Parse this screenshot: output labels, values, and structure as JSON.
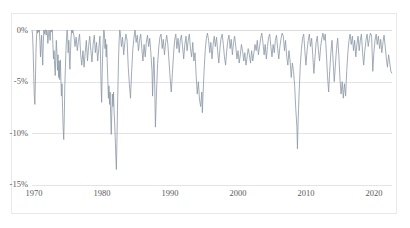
{
  "page": {
    "clipped_top_text": "",
    "background_color": "#ffffff",
    "frame_border_color": "#e9e9ea"
  },
  "chart_data": {
    "type": "line",
    "title": "",
    "subtitle": "",
    "xlabel": "",
    "ylabel": "",
    "grid": true,
    "legend": "none",
    "line_color": "#8a97a5",
    "line_width": 0.8,
    "xlim": [
      1970,
      2023
    ],
    "ylim": [
      -15,
      0
    ],
    "xticks": [
      1970,
      1980,
      1990,
      2000,
      2010,
      2020
    ],
    "xticklabels": [
      "1970",
      "1980",
      "1990",
      "2000",
      "2010",
      "2020"
    ],
    "yticks": [
      0,
      -5,
      -10,
      -15
    ],
    "yticklabels": [
      "0%",
      "-5%",
      "-10%",
      "-15%"
    ],
    "units": "percent",
    "annotations": [],
    "series": [
      {
        "name": "Drawdown",
        "x": [
          1970.0,
          1970.08,
          1970.17,
          1970.25,
          1970.33,
          1970.42,
          1970.5,
          1970.58,
          1970.67,
          1970.75,
          1970.83,
          1970.92,
          1971.0,
          1971.08,
          1971.17,
          1971.25,
          1971.33,
          1971.42,
          1971.5,
          1971.58,
          1971.67,
          1971.75,
          1971.83,
          1971.92,
          1972.0,
          1972.08,
          1972.17,
          1972.25,
          1972.33,
          1972.42,
          1972.5,
          1972.58,
          1972.67,
          1972.75,
          1972.83,
          1972.92,
          1973.0,
          1973.08,
          1973.17,
          1973.25,
          1973.33,
          1973.42,
          1973.5,
          1973.58,
          1973.67,
          1973.75,
          1973.83,
          1973.92,
          1974.0,
          1974.08,
          1974.17,
          1974.25,
          1974.33,
          1974.42,
          1974.5,
          1974.58,
          1974.67,
          1974.75,
          1974.83,
          1974.92,
          1975.0,
          1975.08,
          1975.17,
          1975.25,
          1975.33,
          1975.42,
          1975.5,
          1975.58,
          1975.67,
          1975.75,
          1975.83,
          1975.92,
          1976.0,
          1976.17,
          1976.33,
          1976.5,
          1976.67,
          1976.83,
          1977.0,
          1977.17,
          1977.33,
          1977.5,
          1977.67,
          1977.83,
          1978.0,
          1978.17,
          1978.33,
          1978.5,
          1978.67,
          1978.83,
          1979.0,
          1979.17,
          1979.33,
          1979.5,
          1979.67,
          1979.83,
          1980.0,
          1980.08,
          1980.17,
          1980.25,
          1980.33,
          1980.42,
          1980.5,
          1980.58,
          1980.67,
          1980.75,
          1980.83,
          1980.92,
          1981.0,
          1981.08,
          1981.17,
          1981.25,
          1981.33,
          1981.42,
          1981.5,
          1981.58,
          1981.67,
          1981.75,
          1981.83,
          1981.92,
          1982.0,
          1982.08,
          1982.17,
          1982.25,
          1982.33,
          1982.42,
          1982.5,
          1982.58,
          1982.67,
          1982.75,
          1982.83,
          1982.92,
          1983.0,
          1983.17,
          1983.33,
          1983.5,
          1983.67,
          1983.83,
          1984.0,
          1984.17,
          1984.33,
          1984.5,
          1984.67,
          1984.83,
          1985.0,
          1985.17,
          1985.33,
          1985.5,
          1985.67,
          1985.83,
          1986.0,
          1986.17,
          1986.33,
          1986.5,
          1986.67,
          1986.83,
          1987.0,
          1987.17,
          1987.33,
          1987.5,
          1987.67,
          1987.75,
          1987.83,
          1987.92,
          1988.0,
          1988.08,
          1988.17,
          1988.33,
          1988.5,
          1988.67,
          1988.83,
          1989.0,
          1989.17,
          1989.33,
          1989.5,
          1989.67,
          1989.83,
          1990.0,
          1990.17,
          1990.33,
          1990.5,
          1990.67,
          1990.83,
          1991.0,
          1991.17,
          1991.33,
          1991.5,
          1991.67,
          1991.83,
          1992.0,
          1992.17,
          1992.33,
          1992.5,
          1992.67,
          1992.83,
          1993.0,
          1993.17,
          1993.33,
          1993.5,
          1993.67,
          1993.83,
          1994.0,
          1994.17,
          1994.33,
          1994.5,
          1994.67,
          1994.83,
          1995.0,
          1995.08,
          1995.17,
          1995.33,
          1995.5,
          1995.67,
          1995.83,
          1996.0,
          1996.17,
          1996.33,
          1996.5,
          1996.67,
          1996.83,
          1997.0,
          1997.17,
          1997.33,
          1997.5,
          1997.67,
          1997.83,
          1998.0,
          1998.17,
          1998.33,
          1998.5,
          1998.67,
          1998.83,
          1999.0,
          1999.17,
          1999.33,
          1999.5,
          1999.67,
          1999.83,
          2000.0,
          2000.17,
          2000.33,
          2000.5,
          2000.67,
          2000.83,
          2001.0,
          2001.17,
          2001.33,
          2001.5,
          2001.67,
          2001.83,
          2002.0,
          2002.17,
          2002.33,
          2002.5,
          2002.67,
          2002.83,
          2003.0,
          2003.17,
          2003.33,
          2003.5,
          2003.67,
          2003.83,
          2004.0,
          2004.17,
          2004.33,
          2004.5,
          2004.67,
          2004.83,
          2005.0,
          2005.17,
          2005.33,
          2005.5,
          2005.67,
          2005.83,
          2006.0,
          2006.17,
          2006.33,
          2006.5,
          2006.67,
          2006.83,
          2007.0,
          2007.17,
          2007.33,
          2007.5,
          2007.67,
          2007.83,
          2008.0,
          2008.17,
          2008.33,
          2008.5,
          2008.67,
          2008.83,
          2009.0,
          2009.08,
          2009.17,
          2009.33,
          2009.5,
          2009.67,
          2009.83,
          2010.0,
          2010.17,
          2010.33,
          2010.5,
          2010.67,
          2010.83,
          2011.0,
          2011.17,
          2011.33,
          2011.5,
          2011.67,
          2011.83,
          2012.0,
          2012.17,
          2012.33,
          2012.5,
          2012.67,
          2012.83,
          2013.0,
          2013.17,
          2013.33,
          2013.5,
          2013.67,
          2013.83,
          2014.0,
          2014.17,
          2014.33,
          2014.5,
          2014.67,
          2014.83,
          2015.0,
          2015.17,
          2015.33,
          2015.5,
          2015.67,
          2015.83,
          2016.0,
          2016.17,
          2016.33,
          2016.5,
          2016.67,
          2016.83,
          2017.0,
          2017.17,
          2017.33,
          2017.5,
          2017.67,
          2017.83,
          2018.0,
          2018.17,
          2018.33,
          2018.5,
          2018.67,
          2018.83,
          2019.0,
          2019.17,
          2019.33,
          2019.5,
          2019.67,
          2019.83,
          2020.0,
          2020.17,
          2020.33,
          2020.5,
          2020.67,
          2020.83,
          2021.0,
          2021.17,
          2021.33,
          2021.5,
          2021.67,
          2021.83,
          2022.0,
          2022.17,
          2022.33,
          2022.5,
          2022.67,
          2022.83,
          2023.0
        ],
        "values": [
          0,
          -0.4,
          -2.0,
          -4.2,
          -6.3,
          -7.2,
          -5.0,
          -2.2,
          -0.6,
          0,
          -0.3,
          0,
          -0.2,
          0,
          -1.1,
          -2.6,
          -1.4,
          -0.5,
          -2.3,
          -3.4,
          -1.2,
          0,
          -0.4,
          0,
          0,
          -0.5,
          0,
          -0.2,
          -1.3,
          -0.6,
          0,
          -0.3,
          -1.0,
          0,
          -0.2,
          0,
          0,
          -1.4,
          -2.8,
          -2.0,
          -3.4,
          -4.4,
          -2.6,
          -1.0,
          -2.2,
          -3.9,
          -2.4,
          -4.6,
          -3.0,
          -4.8,
          -2.9,
          -4.6,
          -6.4,
          -5.2,
          -7.6,
          -9.4,
          -10.6,
          -8.6,
          -5.4,
          -3.6,
          -2.0,
          -0.8,
          0,
          -0.6,
          -2.2,
          -1.0,
          -2.6,
          -3.8,
          -2.0,
          -0.7,
          0,
          -0.3,
          0,
          -0.5,
          -1.6,
          -0.7,
          -2.0,
          -1.1,
          -0.4,
          -2.4,
          -3.4,
          -2.0,
          -3.6,
          -2.2,
          -1.0,
          -3.0,
          -1.6,
          -0.6,
          -2.0,
          -3.1,
          -1.4,
          -0.5,
          -2.2,
          -1.2,
          -3.0,
          -1.8,
          -0.6,
          -2.4,
          -5.4,
          -7.0,
          -4.2,
          -2.0,
          -0.8,
          0,
          -0.4,
          -1.8,
          -0.9,
          -2.6,
          -1.4,
          -3.2,
          -5.0,
          -6.6,
          -5.4,
          -7.2,
          -6.0,
          -8.2,
          -10.1,
          -8.0,
          -6.2,
          -7.4,
          -6.0,
          -7.8,
          -9.0,
          -10.4,
          -12.0,
          -13.5,
          -11.0,
          -7.8,
          -5.0,
          -2.6,
          -1.0,
          0,
          -0.3,
          -1.6,
          -0.7,
          -2.4,
          -1.2,
          -0.4,
          -1.0,
          -3.6,
          -5.2,
          -6.6,
          -4.0,
          -2.0,
          -0.8,
          0,
          -1.2,
          -0.5,
          -2.0,
          -1.0,
          -0.4,
          -1.8,
          -3.0,
          -1.4,
          -2.6,
          -1.2,
          -0.5,
          -1.6,
          -0.8,
          -2.2,
          -4.0,
          -6.4,
          -4.4,
          -2.6,
          -3.4,
          -5.8,
          -9.4,
          -6.0,
          -3.2,
          -1.6,
          -0.7,
          -0.4,
          -1.8,
          -0.9,
          -2.4,
          -1.2,
          -0.5,
          -1.4,
          -3.0,
          -4.6,
          -6.0,
          -4.2,
          -2.4,
          -1.0,
          -0.4,
          -1.8,
          -0.8,
          -2.2,
          -1.0,
          -0.5,
          -1.6,
          -2.8,
          -1.4,
          -0.6,
          -2.0,
          -1.0,
          -0.4,
          -1.8,
          -2.6,
          -1.2,
          -3.0,
          -2.2,
          -4.4,
          -6.2,
          -5.0,
          -6.8,
          -7.4,
          -6.0,
          -8.0,
          -6.4,
          -4.0,
          -2.0,
          -0.8,
          -0.3,
          -1.0,
          -2.2,
          -1.2,
          -2.8,
          -1.4,
          -0.6,
          -1.6,
          -0.7,
          -2.0,
          -3.2,
          -1.8,
          -0.8,
          -0.4,
          -1.4,
          -2.6,
          -3.4,
          -2.0,
          -1.0,
          -0.5,
          -1.8,
          -0.9,
          -2.4,
          -1.2,
          -0.6,
          -1.6,
          -2.8,
          -2.0,
          -3.2,
          -2.4,
          -1.4,
          -2.0,
          -3.0,
          -2.2,
          -3.4,
          -2.6,
          -1.8,
          -2.4,
          -3.2,
          -2.0,
          -3.0,
          -2.2,
          -1.4,
          -2.0,
          -1.0,
          -2.4,
          -1.6,
          -0.8,
          -0.3,
          -1.2,
          -2.4,
          -1.4,
          -2.8,
          -1.6,
          -0.7,
          -0.4,
          -1.6,
          -2.6,
          -1.4,
          -2.2,
          -1.0,
          -0.5,
          -1.8,
          -2.8,
          -1.6,
          -0.8,
          -0.3,
          -0.6,
          -2.0,
          -1.0,
          -2.6,
          -3.4,
          -2.0,
          -3.0,
          -4.6,
          -3.2,
          -4.0,
          -5.4,
          -7.6,
          -9.4,
          -11.5,
          -9.0,
          -6.0,
          -3.4,
          -1.8,
          -0.8,
          -0.4,
          -2.0,
          -3.4,
          -2.0,
          -1.0,
          -0.4,
          -1.6,
          -0.8,
          -2.4,
          -4.2,
          -2.6,
          -1.2,
          -0.6,
          -2.0,
          -3.0,
          -1.6,
          -0.8,
          -0.3,
          -1.0,
          -0.4,
          -2.2,
          -4.4,
          -6.0,
          -4.0,
          -2.2,
          -1.0,
          -3.0,
          -5.0,
          -3.4,
          -1.8,
          -0.8,
          -2.4,
          -4.6,
          -6.2,
          -5.0,
          -6.6,
          -5.2,
          -6.4,
          -4.0,
          -2.2,
          -1.0,
          -0.4,
          -1.4,
          -0.6,
          -2.0,
          -1.0,
          -2.6,
          -1.4,
          -0.6,
          -2.0,
          -1.0,
          -0.4,
          -2.2,
          -3.4,
          -2.0,
          -1.0,
          -0.4,
          -1.6,
          -0.8,
          -0.3,
          -0.6,
          -4.0,
          -2.2,
          -1.0,
          -0.4,
          -1.4,
          -0.6,
          -1.8,
          -0.9,
          -2.2,
          -1.2,
          -0.5,
          -1.6,
          -2.8,
          -3.6,
          -2.4,
          -3.2,
          -4.0,
          -4.2
        ]
      }
    ]
  }
}
